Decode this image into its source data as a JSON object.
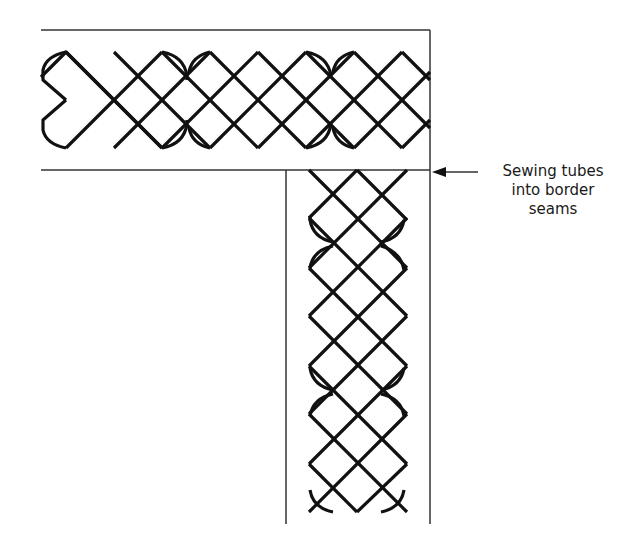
{
  "diagram": {
    "annotation": {
      "lines": [
        "Sewing tubes",
        "into border",
        "seams"
      ]
    },
    "colors": {
      "stroke": "#111111",
      "border": "#333333",
      "background": "#ffffff"
    }
  }
}
